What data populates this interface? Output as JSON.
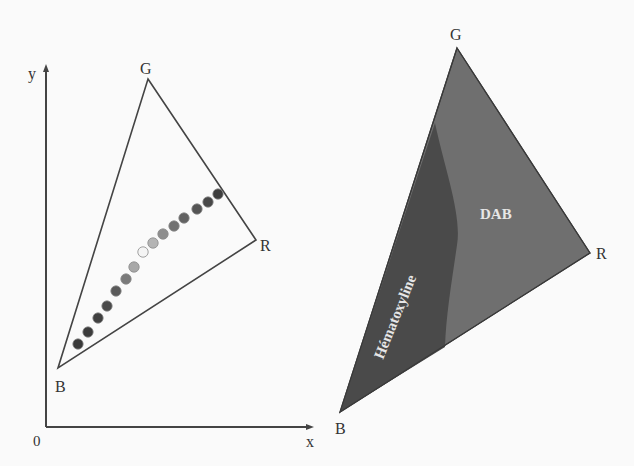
{
  "left_diagram": {
    "axes": {
      "x_label": "x",
      "y_label": "y",
      "origin_label": "0"
    },
    "vertices": [
      {
        "label": "G",
        "x": 148,
        "y": 77
      },
      {
        "label": "R",
        "x": 256,
        "y": 240
      },
      {
        "label": "B",
        "x": 58,
        "y": 368
      }
    ],
    "dots": [
      {
        "x": 78,
        "y": 344,
        "fill": "#3a3a3a"
      },
      {
        "x": 88,
        "y": 332,
        "fill": "#3c3c3c"
      },
      {
        "x": 98,
        "y": 318,
        "fill": "#404040"
      },
      {
        "x": 107,
        "y": 306,
        "fill": "#4a4a4a"
      },
      {
        "x": 116,
        "y": 291,
        "fill": "#5a5a5a"
      },
      {
        "x": 126,
        "y": 279,
        "fill": "#7a7a7a"
      },
      {
        "x": 134,
        "y": 267,
        "fill": "#a8a8a8"
      },
      {
        "x": 143,
        "y": 252,
        "fill": "#f4f4f4"
      },
      {
        "x": 153,
        "y": 243,
        "fill": "#b4b4b4"
      },
      {
        "x": 163,
        "y": 234,
        "fill": "#8e8e8e"
      },
      {
        "x": 174,
        "y": 226,
        "fill": "#727272"
      },
      {
        "x": 184,
        "y": 218,
        "fill": "#626262"
      },
      {
        "x": 197,
        "y": 209,
        "fill": "#545454"
      },
      {
        "x": 208,
        "y": 202,
        "fill": "#484848"
      },
      {
        "x": 218,
        "y": 194,
        "fill": "#3e3e3e"
      }
    ]
  },
  "right_diagram": {
    "vertices": [
      {
        "label": "G",
        "x": 457,
        "y": 48
      },
      {
        "label": "R",
        "x": 590,
        "y": 253
      },
      {
        "label": "B",
        "x": 340,
        "y": 412
      }
    ],
    "regions": [
      {
        "label": "Hématoxyline",
        "fill": "#4a4a4a"
      },
      {
        "label": "DAB",
        "fill": "#6f6f6f"
      }
    ]
  }
}
